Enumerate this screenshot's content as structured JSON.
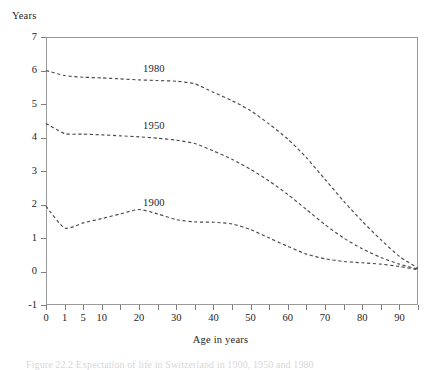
{
  "figure": {
    "caption": "Figure 22.2  Expectation of life in Switzerland in 1900, 1950 and 1980"
  },
  "chart_data": {
    "type": "line",
    "title": "",
    "xlabel": "Age in years",
    "ylabel": "Years",
    "grid": false,
    "legend_position": "inline-labels",
    "line_style": "dashed",
    "xlim": [
      0,
      95
    ],
    "ylim": [
      -1,
      7
    ],
    "y_ticks": [
      -1,
      0,
      1,
      2,
      3,
      4,
      5,
      6,
      7
    ],
    "y_tick_labels": [
      "-1",
      "0",
      "1",
      "2",
      "3",
      "4",
      "5",
      "6",
      "7"
    ],
    "x_axis_type": "non-uniform-categorical",
    "x_positions": [
      0,
      1,
      5,
      10,
      15,
      20,
      25,
      30,
      35,
      40,
      45,
      50,
      55,
      60,
      65,
      70,
      75,
      80,
      85,
      90,
      95
    ],
    "x_tick_labels": [
      "0",
      "1",
      "5",
      "10",
      "",
      "20",
      "",
      "30",
      "",
      "40",
      "",
      "50",
      "",
      "60",
      "",
      "70",
      "",
      "80",
      "",
      "90",
      ""
    ],
    "series": [
      {
        "name": "1980",
        "label_x": 20,
        "label_y": 6.05,
        "x": [
          0,
          1,
          5,
          10,
          15,
          20,
          25,
          30,
          35,
          40,
          45,
          50,
          55,
          60,
          65,
          70,
          75,
          80,
          85,
          90,
          95
        ],
        "values": [
          6.0,
          5.85,
          5.8,
          5.78,
          5.75,
          5.72,
          5.7,
          5.68,
          5.6,
          5.35,
          5.1,
          4.8,
          4.4,
          3.95,
          3.4,
          2.75,
          2.1,
          1.5,
          0.95,
          0.45,
          0.1
        ]
      },
      {
        "name": "1950",
        "label_x": 20,
        "label_y": 4.35,
        "x": [
          0,
          1,
          5,
          10,
          15,
          20,
          25,
          30,
          35,
          40,
          45,
          50,
          55,
          60,
          65,
          70,
          75,
          80,
          85,
          90,
          95
        ],
        "values": [
          4.42,
          4.12,
          4.1,
          4.08,
          4.05,
          4.02,
          3.98,
          3.92,
          3.82,
          3.6,
          3.35,
          3.05,
          2.7,
          2.3,
          1.85,
          1.4,
          1.0,
          0.68,
          0.42,
          0.22,
          0.07
        ]
      },
      {
        "name": "1900",
        "label_x": 20,
        "label_y": 2.05,
        "x": [
          0,
          1,
          5,
          10,
          15,
          20,
          25,
          30,
          35,
          40,
          45,
          50,
          55,
          60,
          65,
          70,
          75,
          80,
          85,
          90,
          95
        ],
        "values": [
          1.95,
          1.3,
          1.45,
          1.58,
          1.72,
          1.85,
          1.72,
          1.55,
          1.48,
          1.47,
          1.42,
          1.25,
          1.0,
          0.75,
          0.52,
          0.38,
          0.3,
          0.26,
          0.22,
          0.15,
          0.05
        ]
      }
    ]
  }
}
